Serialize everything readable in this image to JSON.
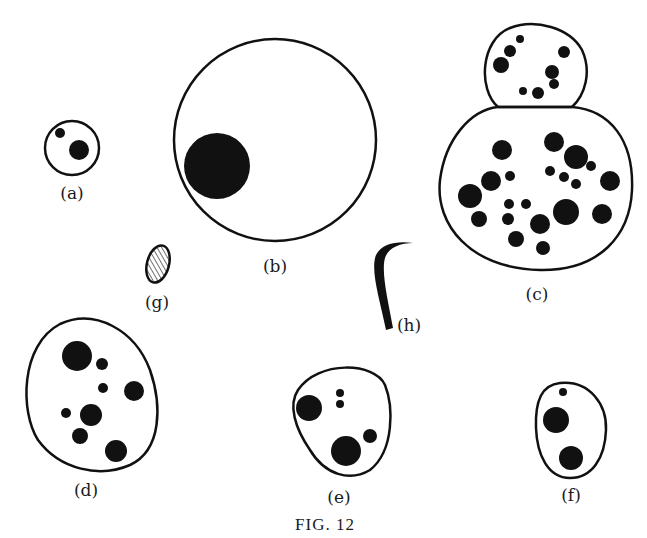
{
  "figure": {
    "caption": "Fig. 12",
    "caption_display": "FIG. 12",
    "ink_color": "#111111",
    "background": "#ffffff"
  },
  "panels": [
    {
      "id": "a",
      "label": "(a)",
      "shape": "small circle",
      "dots": 2
    },
    {
      "id": "b",
      "label": "(b)",
      "shape": "large circle",
      "dots": 1
    },
    {
      "id": "c",
      "label": "(c)",
      "shape": "budding cell (two joined rounded bodies)",
      "dots": 29
    },
    {
      "id": "d",
      "label": "(d)",
      "shape": "oval",
      "dots": 9
    },
    {
      "id": "e",
      "label": "(e)",
      "shape": "rounded oval",
      "dots": 5
    },
    {
      "id": "f",
      "label": "(f)",
      "shape": "egg-shaped oval",
      "dots": 3
    },
    {
      "id": "g",
      "label": "(g)",
      "shape": "small hatched ellipse",
      "dots": 0
    },
    {
      "id": "h",
      "label": "(h)",
      "shape": "curved hook",
      "dots": 0
    }
  ]
}
